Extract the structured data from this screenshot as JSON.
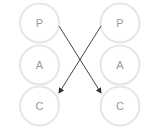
{
  "diagram": {
    "left_column": {
      "states": [
        {
          "label": "P",
          "cx": 39.5,
          "cy": 23
        },
        {
          "label": "A",
          "cx": 39.5,
          "cy": 65
        },
        {
          "label": "C",
          "cx": 39.5,
          "cy": 106
        }
      ]
    },
    "right_column": {
      "states": [
        {
          "label": "P",
          "cx": 120,
          "cy": 23
        },
        {
          "label": "A",
          "cx": 120,
          "cy": 65
        },
        {
          "label": "C",
          "cx": 120,
          "cy": 106
        }
      ]
    },
    "arrows": [
      {
        "from": "left.P",
        "to": "right.C",
        "x1": 59,
        "y1": 26,
        "x2": 101,
        "y2": 93
      },
      {
        "from": "right.P",
        "to": "left.C",
        "x1": 101,
        "y1": 26,
        "x2": 59,
        "y2": 93
      }
    ],
    "colors": {
      "circle_stroke": "#e6e6e6",
      "label": "#9a9a9a",
      "arrow": "#444444"
    }
  }
}
